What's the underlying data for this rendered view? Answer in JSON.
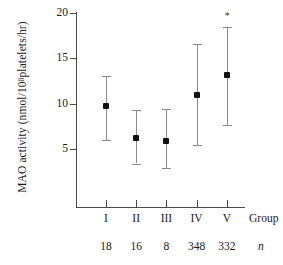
{
  "chart_data": {
    "type": "scatter",
    "title": "",
    "xlabel": "Group",
    "ylabel": "MAO activity (nmol/10^8 platelets/hr)",
    "ylabel_prefix": "MAO activity (nmol/10",
    "ylabel_exponent": "8",
    "ylabel_suffix": " platelets/hr)",
    "categories": [
      "I",
      "II",
      "III",
      "IV",
      "V"
    ],
    "values": [
      9.7,
      6.2,
      5.9,
      11.0,
      13.2
    ],
    "error_low": [
      6.0,
      3.4,
      2.9,
      5.4,
      7.6
    ],
    "error_high": [
      13.1,
      9.3,
      9.4,
      16.6,
      18.5
    ],
    "annotations": [
      "",
      "",
      "",
      "",
      "*"
    ],
    "ylim": [
      0,
      20
    ],
    "yticks": [
      5,
      10,
      15,
      20
    ],
    "ytick_labels": [
      "5",
      "10",
      "15",
      "20"
    ],
    "grid": false,
    "legend": false,
    "marker_color": "#111111",
    "whisker_color": "#8a8a8a",
    "axis_color": "#4a4a4a",
    "n_row_label": "n",
    "n_values": [
      "18",
      "16",
      "8",
      "348",
      "332"
    ],
    "series": [
      {
        "name": "MAO activity mean with range",
        "values": [
          9.7,
          6.2,
          5.9,
          11.0,
          13.2
        ]
      }
    ]
  },
  "axes": {
    "y_title_prefix": "MAO activity (nmol/10",
    "y_title_exponent": "8",
    "y_title_suffix": " platelets/hr)",
    "x_row_title": "Group",
    "n_row_title": "n"
  },
  "ticks": {
    "y": [
      {
        "label": "20",
        "value": 20
      },
      {
        "label": "15",
        "value": 15
      },
      {
        "label": "10",
        "value": 10
      },
      {
        "label": "5",
        "value": 5
      }
    ]
  },
  "groups": [
    {
      "category": "I",
      "n": "18",
      "mean": 9.7,
      "low": 6.0,
      "high": 13.1,
      "annotation": ""
    },
    {
      "category": "II",
      "n": "16",
      "mean": 6.2,
      "low": 3.4,
      "high": 9.3,
      "annotation": ""
    },
    {
      "category": "III",
      "n": "8",
      "mean": 5.9,
      "low": 2.9,
      "high": 9.4,
      "annotation": ""
    },
    {
      "category": "IV",
      "n": "348",
      "mean": 11.0,
      "low": 5.4,
      "high": 16.6,
      "annotation": ""
    },
    {
      "category": "V",
      "n": "332",
      "mean": 13.2,
      "low": 7.6,
      "high": 18.5,
      "annotation": "*"
    }
  ]
}
